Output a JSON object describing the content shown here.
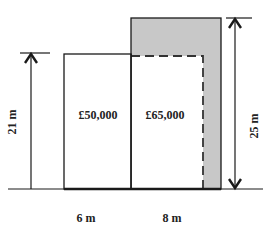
{
  "diagram": {
    "plots": [
      {
        "id": "plot-a",
        "value_label": "£50,000",
        "width_label": "6 m"
      },
      {
        "id": "plot-b",
        "value_label": "£65,000",
        "width_label": "8 m"
      }
    ],
    "heights": {
      "left": "21 m",
      "right": "25 m"
    },
    "colors": {
      "shaded": "#c8c8c8",
      "line": "#1a1a1a",
      "background": "#ffffff"
    }
  }
}
